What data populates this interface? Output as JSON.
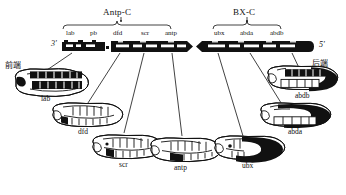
{
  "figure": {
    "type": "diagram",
    "orientation_labels": {
      "anterior": "前端",
      "posterior": "后端",
      "five_prime": "5'",
      "three_prime": "3'"
    },
    "complexes": [
      {
        "id": "antp-c",
        "title": "Antp-C",
        "genes": [
          "lab",
          "pb",
          "dfd",
          "scr",
          "antp"
        ]
      },
      {
        "id": "bx-c",
        "title": "BX-C",
        "genes": [
          "ubx",
          "abda",
          "abdb"
        ]
      }
    ],
    "embryos": [
      {
        "id": "lab",
        "label": "lab",
        "domain": "anterior-head"
      },
      {
        "id": "dfd",
        "label": "dfd",
        "domain": "head-gnathal"
      },
      {
        "id": "scr",
        "label": "scr",
        "domain": "labial-prothoracic"
      },
      {
        "id": "antp",
        "label": "antp",
        "domain": "thoracic"
      },
      {
        "id": "ubx",
        "label": "ubx",
        "domain": "posterior-thorax-abdomen"
      },
      {
        "id": "abda",
        "label": "abda",
        "domain": "abdominal"
      },
      {
        "id": "abdb",
        "label": "abdb",
        "domain": "posterior-abdomen"
      }
    ],
    "colors": {
      "ink": "#111111",
      "expression_fill": "#000000",
      "background": "#ffffff"
    }
  }
}
